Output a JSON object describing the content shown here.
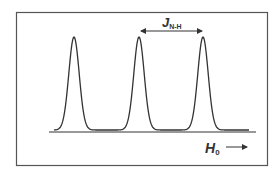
{
  "figure": {
    "type": "nmr-spectrum-schematic",
    "peaks_count": 3,
    "labels": {
      "coupling_symbol": "J",
      "coupling_subscript": "N-H",
      "field_symbol": "H",
      "field_subscript": "0",
      "field_arrow": "→"
    },
    "colors": {
      "line": "#333333",
      "frame": "#555555",
      "background": "#ffffff"
    }
  }
}
